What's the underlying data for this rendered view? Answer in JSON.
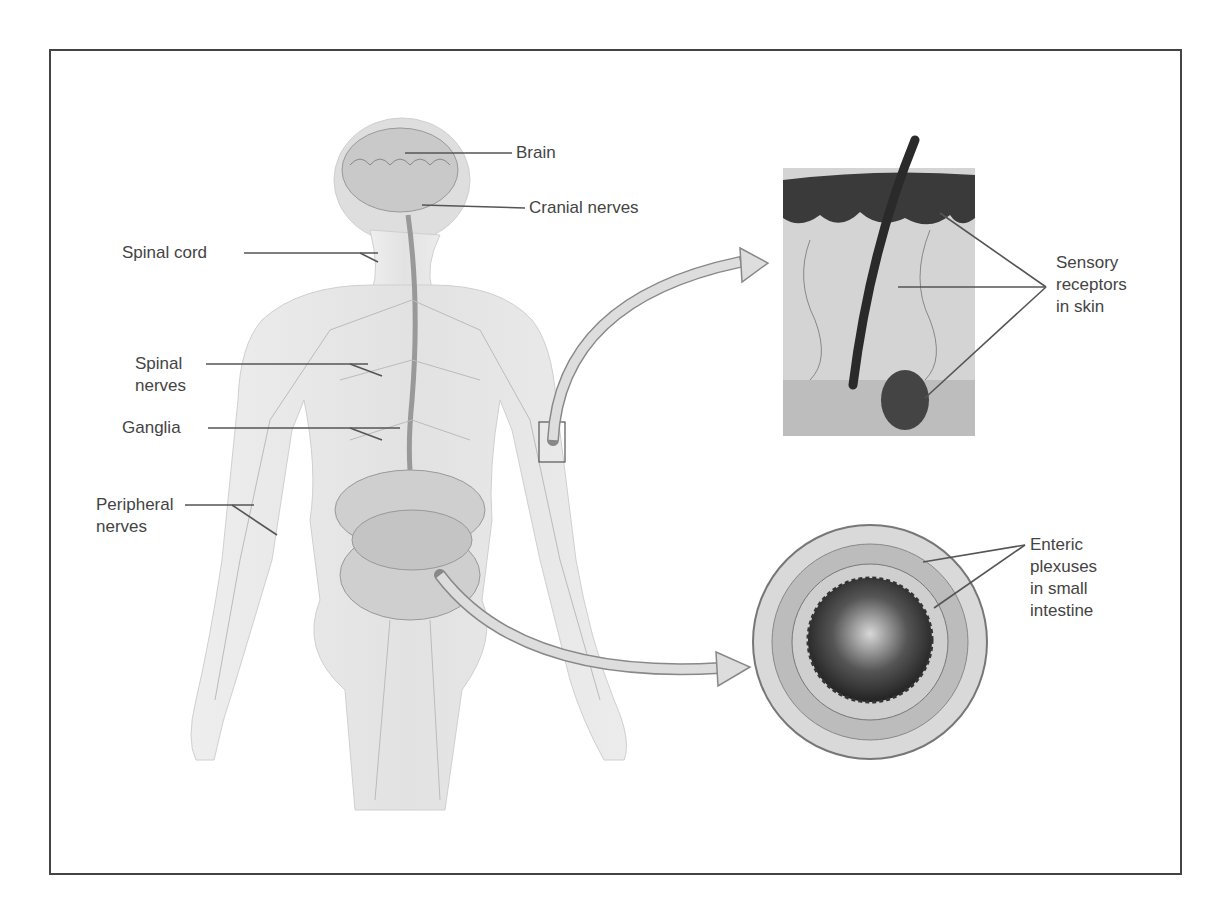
{
  "figure": {
    "labels": {
      "brain": "Brain",
      "cranial_nerves": "Cranial nerves",
      "spinal_cord": "Spinal cord",
      "spinal_nerves_1": "Spinal",
      "spinal_nerves_2": "nerves",
      "ganglia": "Ganglia",
      "peripheral_nerves_1": "Peripheral",
      "peripheral_nerves_2": "nerves",
      "sensory_1": "Sensory",
      "sensory_2": "receptors",
      "sensory_3": "in skin",
      "enteric_1": "Enteric",
      "enteric_2": "plexuses",
      "enteric_3": "in small",
      "enteric_4": "intestine"
    },
    "colors": {
      "frame": "#444444",
      "body_fill": "#e6e6e6",
      "leader_line": "#555555",
      "text": "#444444"
    }
  }
}
